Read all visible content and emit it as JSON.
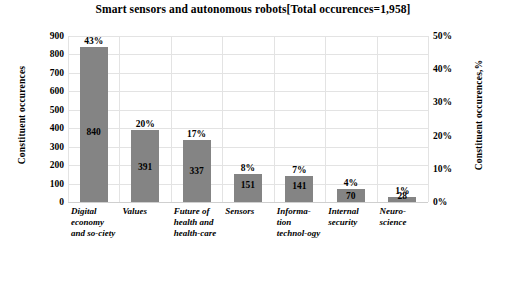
{
  "chart_data": {
    "type": "bar",
    "title": "Smart sensors and autonomous robots[Total occurences=1,958]",
    "categories": [
      "Digital economy and so-ciety",
      "Values",
      "Future of health and health-care",
      "Sensors",
      "Informa-tion technol-ogy",
      "Internal security",
      "Neuro-science"
    ],
    "values": [
      840,
      391,
      337,
      151,
      141,
      70,
      28
    ],
    "percent_labels": [
      "43%",
      "20%",
      "17%",
      "8%",
      "7%",
      "4%",
      "1%"
    ],
    "value_labels": [
      "840",
      "391",
      "337",
      "151",
      "141",
      "70",
      "28"
    ],
    "xlabel": "",
    "ylabel": "Constituent occurences",
    "ylabel_right": "Constituent occurences,%",
    "ylim": [
      0,
      900
    ],
    "ylim_right": [
      0,
      50
    ],
    "yticks": [
      "0",
      "100",
      "200",
      "300",
      "400",
      "500",
      "600",
      "700",
      "800",
      "900"
    ],
    "yticks_right": [
      "0%",
      "10%",
      "20%",
      "30%",
      "40%",
      "50%"
    ],
    "grid": true,
    "legend": "none",
    "bar_color": "#848484",
    "grid_color": "#e3e3e3",
    "total_occurrences": "1,958"
  }
}
